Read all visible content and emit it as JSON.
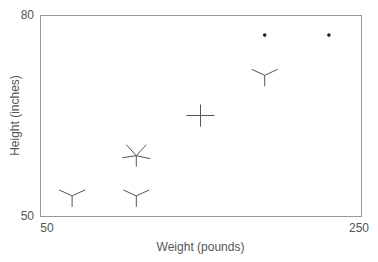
{
  "chart_data": {
    "type": "scatter",
    "title": "",
    "xlabel": "Weight (pounds)",
    "ylabel": "Height (inches)",
    "xlim": [
      50,
      250
    ],
    "ylim": [
      50,
      80
    ],
    "x_ticks": [
      "50",
      "250"
    ],
    "y_ticks": [
      "50",
      "80"
    ],
    "grid": false,
    "legend": null,
    "marker_style": "star glyphs (multivariate symbols)",
    "points": [
      {
        "x": 70,
        "y": 53,
        "glyph": "three-ray-y"
      },
      {
        "x": 110,
        "y": 53,
        "glyph": "three-ray-y"
      },
      {
        "x": 110,
        "y": 59,
        "glyph": "five-ray-star"
      },
      {
        "x": 150,
        "y": 65,
        "glyph": "four-ray-plus"
      },
      {
        "x": 190,
        "y": 71,
        "glyph": "three-ray-y"
      },
      {
        "x": 190,
        "y": 77,
        "glyph": "dot"
      },
      {
        "x": 230,
        "y": 77,
        "glyph": "dot"
      }
    ]
  },
  "frame": {
    "left": 40,
    "top": 15,
    "right": 361,
    "bottom": 216
  },
  "colors": {
    "frame": "#999999",
    "glyph": "#555555",
    "dot": "#222222",
    "text": "#555555"
  }
}
